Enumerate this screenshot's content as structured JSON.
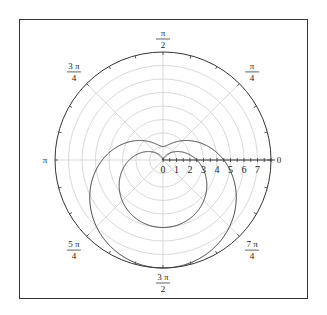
{
  "chart_data": {
    "type": "polar-line",
    "title": "",
    "center_px": [
      163,
      160
    ],
    "px_per_unit": 13.5,
    "r_max": 8,
    "radial_ticks": [
      "0",
      "1",
      "2",
      "3",
      "4",
      "5",
      "6",
      "7"
    ],
    "radial_grid": [
      1,
      2,
      3,
      4,
      5,
      6,
      7
    ],
    "angular_grid_step": "pi/4",
    "angular_labels": [
      {
        "angle_deg": 0,
        "num": "0",
        "den": ""
      },
      {
        "angle_deg": 45,
        "num": "π",
        "den": "4"
      },
      {
        "angle_deg": 90,
        "num": "π",
        "den": "2"
      },
      {
        "angle_deg": 135,
        "num": "3 π",
        "den": "4"
      },
      {
        "angle_deg": 180,
        "num": "π",
        "den": ""
      },
      {
        "angle_deg": 225,
        "num": "5 π",
        "den": "4"
      },
      {
        "angle_deg": 270,
        "num": "3 π",
        "den": "2"
      },
      {
        "angle_deg": 315,
        "num": "7 π",
        "den": "4"
      }
    ],
    "series": [
      {
        "name": "outer limaçon",
        "equation": "r = 4.5 - 3.5 sin(θ)",
        "a": 4.5,
        "b": -3.5,
        "color": "#333333"
      },
      {
        "name": "inner cardioid",
        "equation": "r = 2.5 - 2.5 sin(θ)",
        "a": 2.5,
        "b": -2.5,
        "color": "#333333"
      }
    ],
    "colors": {
      "grid": "#cfcfcf",
      "axis": "#333333",
      "curve": "#3a3a3a",
      "frame": "#333333"
    }
  }
}
